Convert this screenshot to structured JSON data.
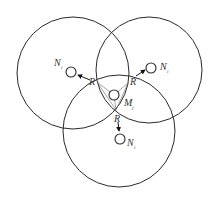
{
  "diagram": {
    "title": "",
    "circles": [
      {
        "name": "coverage-left",
        "cx": 73,
        "cy": 73,
        "r": 56
      },
      {
        "name": "coverage-right",
        "cx": 149,
        "cy": 70,
        "r": 53
      },
      {
        "name": "coverage-bottom",
        "cx": 119,
        "cy": 131,
        "r": 56
      }
    ],
    "nodes": {
      "left": {
        "label": "N",
        "sub": "i",
        "cx": 71,
        "cy": 72
      },
      "right": {
        "label": "N",
        "sub": "i",
        "cx": 151,
        "cy": 68
      },
      "bottom": {
        "label": "N",
        "sub": "i",
        "cx": 120,
        "cy": 139
      },
      "center": {
        "label": "M",
        "sub": "j",
        "cx": 114,
        "cy": 95
      }
    },
    "radius_labels": {
      "left": "R",
      "right": "R",
      "bottom": "R"
    }
  }
}
